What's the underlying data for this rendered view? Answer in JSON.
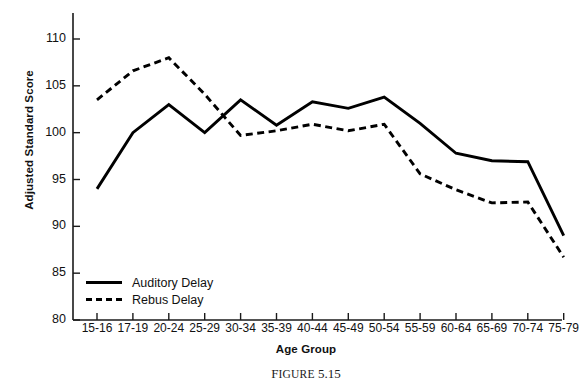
{
  "chart_data": {
    "type": "line",
    "title": "",
    "xlabel": "Age Group",
    "ylabel": "Adjusted Standard Score",
    "categories": [
      "15-16",
      "17-19",
      "20-24",
      "25-29",
      "30-34",
      "35-39",
      "40-44",
      "45-49",
      "50-54",
      "55-59",
      "60-64",
      "65-69",
      "70-74",
      "75-79"
    ],
    "ylim": [
      80,
      112
    ],
    "yticks": [
      80,
      85,
      90,
      95,
      100,
      105,
      110
    ],
    "grid": false,
    "legend_position": "lower-left-inside",
    "series": [
      {
        "name": "Auditory Delay",
        "style": "solid",
        "color": "#000000",
        "values": [
          94.0,
          100.0,
          103.0,
          100.0,
          103.5,
          100.8,
          103.3,
          102.6,
          103.8,
          101.0,
          97.8,
          97.0,
          96.9,
          89.0
        ]
      },
      {
        "name": "Rebus Delay",
        "style": "dashed",
        "color": "#000000",
        "values": [
          103.5,
          106.6,
          108.0,
          104.1,
          99.7,
          100.2,
          100.9,
          100.2,
          100.9,
          95.6,
          93.9,
          92.5,
          92.6,
          86.7
        ]
      }
    ]
  },
  "axes": {
    "y_title": "Adjusted Standard Score",
    "x_title": "Age Group",
    "y_tick_labels": [
      "110",
      "105",
      "100",
      "95",
      "90",
      "85",
      "80"
    ],
    "x_tick_labels": [
      "15-16",
      "17-19",
      "20-24",
      "25-29",
      "30-34",
      "35-39",
      "40-44",
      "45-49",
      "50-54",
      "55-59",
      "60-64",
      "65-69",
      "70-74",
      "75-79"
    ]
  },
  "legend": {
    "items": [
      {
        "label": "Auditory Delay",
        "style": "solid"
      },
      {
        "label": "Rebus Delay",
        "style": "dashed"
      }
    ]
  },
  "caption": {
    "prefix": "F",
    "word": "IGURE",
    "number": "5.15",
    "full": "FIGURE 5.15"
  },
  "colors": {
    "line": "#000000",
    "axis": "#1a1a1a",
    "background": "#ffffff"
  }
}
